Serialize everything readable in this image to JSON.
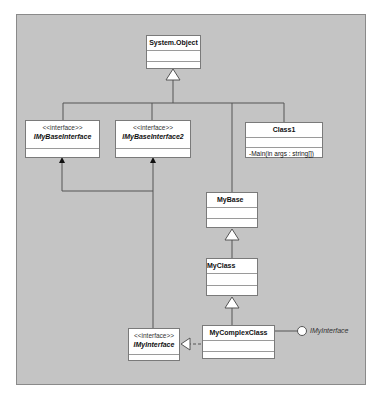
{
  "diagram": {
    "type": "uml-class-diagram",
    "background_color": "#c4c4c4",
    "classes": [
      {
        "id": "system-object",
        "name": "System.Object",
        "stereotype": null,
        "italic": false,
        "operations": []
      },
      {
        "id": "imybaseinterface",
        "name": "IMyBaseInterface",
        "stereotype": "<<interface>>",
        "italic": true,
        "operations": []
      },
      {
        "id": "imybaseinterface2",
        "name": "IMyBaseInterface2",
        "stereotype": "<<interface>>",
        "italic": true,
        "operations": []
      },
      {
        "id": "class1",
        "name": "Class1",
        "stereotype": null,
        "italic": false,
        "operations": [
          "-Main(in args : string[])"
        ]
      },
      {
        "id": "mybase",
        "name": "MyBase",
        "stereotype": null,
        "italic": false,
        "operations": []
      },
      {
        "id": "myclass",
        "name": "MyClass",
        "stereotype": null,
        "italic": false,
        "operations": []
      },
      {
        "id": "imyinterface",
        "name": "IMyInterface",
        "stereotype": "<<interface>>",
        "italic": true,
        "operations": []
      },
      {
        "id": "mycomplexclass",
        "name": "MyComplexClass",
        "stereotype": null,
        "italic": false,
        "operations": []
      }
    ],
    "relations": [
      {
        "from": "IMyBaseInterface",
        "to": "System.Object",
        "kind": "generalization"
      },
      {
        "from": "IMyBaseInterface2",
        "to": "System.Object",
        "kind": "generalization"
      },
      {
        "from": "MyBase",
        "to": "System.Object",
        "kind": "generalization"
      },
      {
        "from": "Class1",
        "to": "System.Object",
        "kind": "generalization"
      },
      {
        "from": "MyClass",
        "to": "MyBase",
        "kind": "generalization"
      },
      {
        "from": "MyComplexClass",
        "to": "MyClass",
        "kind": "generalization"
      },
      {
        "from": "IMyInterface",
        "to": "IMyBaseInterface",
        "kind": "association"
      },
      {
        "from": "IMyInterface",
        "to": "IMyBaseInterface2",
        "kind": "association"
      },
      {
        "from": "MyComplexClass",
        "to": "IMyInterface",
        "kind": "realization"
      },
      {
        "from": "MyComplexClass",
        "to": "IMyInterface",
        "kind": "lollipop-interface"
      }
    ],
    "lollipop_label": "IMyInterface"
  }
}
